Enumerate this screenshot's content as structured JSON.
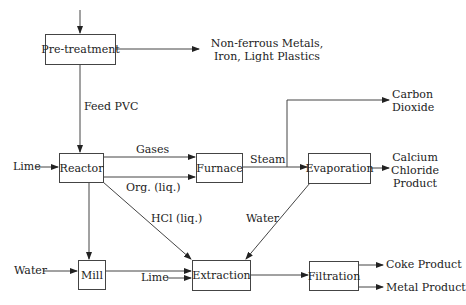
{
  "diagram": {
    "type": "process-flow",
    "nodes": {
      "pretreatment": "Pre-treatment",
      "reactor": "Reactor",
      "furnace": "Furnace",
      "evaporation": "Evaporation",
      "mill": "Mill",
      "extraction": "Extraction",
      "filtration": "Filtration"
    },
    "labels": {
      "nonferrous_line1": "Non-ferrous Metals,",
      "nonferrous_line2": "Iron, Light Plastics",
      "feed_pvc": "Feed PVC",
      "lime_reactor": "Lime",
      "gases": "Gases",
      "org_liq": "Org. (liq.)",
      "steam": "Steam",
      "carbon_line1": "Carbon",
      "carbon_line2": "Dioxide",
      "calcium_line1": "Calcium",
      "calcium_line2": "Chloride",
      "calcium_line3": "Product",
      "hcl_liq": "HCl (liq.)",
      "water_evap": "Water",
      "water_mill": "Water",
      "lime_extraction": "Lime",
      "coke_product": "Coke Product",
      "metal_product": "Metal Product"
    },
    "edges": [
      {
        "from": "input",
        "to": "Pre-treatment"
      },
      {
        "from": "Pre-treatment",
        "to": "Non-ferrous Metals, Iron, Light Plastics"
      },
      {
        "from": "Pre-treatment",
        "to": "Reactor",
        "label": "Feed PVC"
      },
      {
        "from": "Lime",
        "to": "Reactor"
      },
      {
        "from": "Reactor",
        "to": "Furnace",
        "label": "Gases"
      },
      {
        "from": "Reactor",
        "to": "Furnace",
        "label": "Org. (liq.)"
      },
      {
        "from": "Reactor",
        "to": "Mill"
      },
      {
        "from": "Reactor",
        "to": "Extraction",
        "label": "HCl (liq.)"
      },
      {
        "from": "Furnace",
        "to": "Evaporation",
        "label": "Steam"
      },
      {
        "from": "Furnace",
        "to": "Carbon Dioxide"
      },
      {
        "from": "Evaporation",
        "to": "Calcium Chloride Product"
      },
      {
        "from": "Evaporation",
        "to": "Extraction",
        "label": "Water"
      },
      {
        "from": "Water",
        "to": "Mill"
      },
      {
        "from": "Mill",
        "to": "Extraction"
      },
      {
        "from": "Lime",
        "to": "Extraction"
      },
      {
        "from": "Extraction",
        "to": "Filtration"
      },
      {
        "from": "Filtration",
        "to": "Coke Product"
      },
      {
        "from": "Filtration",
        "to": "Metal Product"
      }
    ]
  }
}
